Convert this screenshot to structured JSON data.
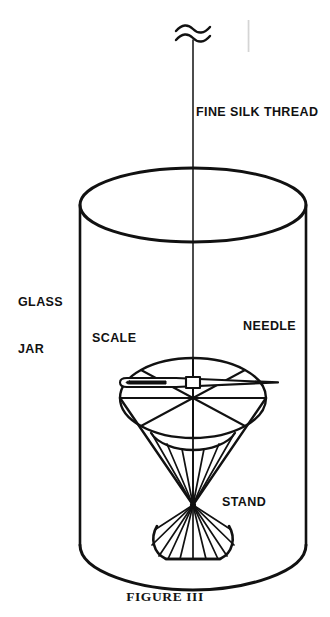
{
  "figure": {
    "caption": "FIGURE III",
    "title": "FIGURE III",
    "background_color": "#ffffff",
    "ink_color": "#111111"
  },
  "labels": {
    "thread": "FINE SILK THREAD",
    "glass_jar_line1": "GLASS",
    "glass_jar_line2": "JAR",
    "scale": "SCALE",
    "needle": "NEEDLE",
    "stand": "STAND"
  },
  "parts": [
    {
      "name": "fine-silk-thread",
      "label": "FINE SILK THREAD",
      "description": "vertical thread with break symbol at top"
    },
    {
      "name": "glass-jar",
      "label": "GLASS JAR",
      "description": "open cylinder enclosing apparatus"
    },
    {
      "name": "scale",
      "label": "SCALE",
      "description": "circular dial with eight radial spokes"
    },
    {
      "name": "needle",
      "label": "NEEDLE",
      "description": "magnetized sewing needle with eye at left"
    },
    {
      "name": "stand",
      "label": "STAND",
      "description": "double cone wireframe support"
    }
  ],
  "geometry": {
    "jar": {
      "cx": 193,
      "top_rim_cy": 205,
      "rx": 113,
      "ry": 37,
      "wall_left": 80,
      "wall_right": 306,
      "bottom_cy": 557,
      "bottom_ry": 33
    },
    "thread": {
      "x": 193,
      "y_top": 40,
      "y_bottom": 398
    },
    "break_symbol": {
      "x": 193,
      "y": 32
    },
    "scale": {
      "cx": 193,
      "cy": 398,
      "rx": 73,
      "ry": 40
    },
    "needle": {
      "x_eye": 125,
      "x_tip": 278,
      "y": 383
    },
    "stand": {
      "waist_x": 193,
      "waist_y": 505,
      "base_cy": 557,
      "base_rx": 38,
      "base_ry": 18
    }
  }
}
